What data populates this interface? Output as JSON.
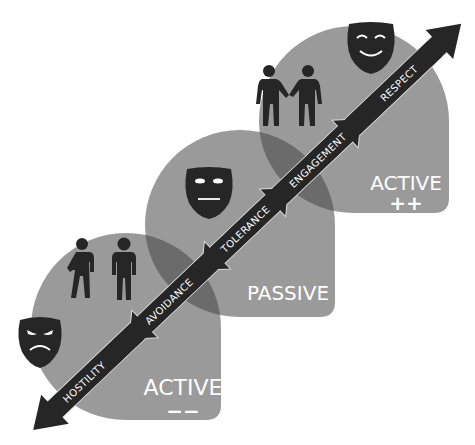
{
  "diagram": {
    "colors": {
      "zone_fill": "#9a9a9a",
      "zone_overlap": "#6b6b6b",
      "arrow_fill": "#262626",
      "arrow_outline": "#d9d9d9",
      "icon_fill": "#262626",
      "text_light": "#ffffff"
    },
    "zones": [
      {
        "id": "active-negative",
        "label": "ACTIVE",
        "sign": "−−",
        "mask": "angry-mask-icon",
        "figures": "two-people-avoiding-icon"
      },
      {
        "id": "passive",
        "label": "PASSIVE",
        "sign": "",
        "mask": "neutral-mask-icon",
        "figures": ""
      },
      {
        "id": "active-positive",
        "label": "ACTIVE",
        "sign": "++",
        "mask": "happy-mask-icon",
        "figures": "two-people-shaking-hands-icon"
      }
    ],
    "arrow_segments": [
      {
        "label": "HOSTILITY"
      },
      {
        "label": "AVOIDANCE"
      },
      {
        "label": "TOLERANCE"
      },
      {
        "label": "ENGAGEMENT"
      },
      {
        "label": "RESPECT"
      }
    ]
  }
}
